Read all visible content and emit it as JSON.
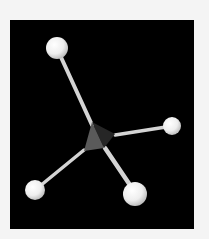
{
  "image": {
    "subject": "ball-and-stick molecular model, tetrahedral (methane-like)",
    "background_color": "#f4f4f4",
    "panel_color": "#000000",
    "panel": {
      "x": 10,
      "y": 20,
      "width": 184,
      "height": 209
    }
  },
  "molecule": {
    "central_atom": {
      "label": "C",
      "x": 95,
      "y": 140,
      "color": "#4a4a4a"
    },
    "atoms": [
      {
        "label": "H",
        "x": 57,
        "y": 48,
        "r": 11
      },
      {
        "label": "H",
        "x": 172,
        "y": 126,
        "r": 9
      },
      {
        "label": "H",
        "x": 35,
        "y": 190,
        "r": 10
      },
      {
        "label": "H",
        "x": 135,
        "y": 194,
        "r": 12
      }
    ],
    "atom_color": "#f2f2f2",
    "bond_color": "#d8d8d8"
  }
}
